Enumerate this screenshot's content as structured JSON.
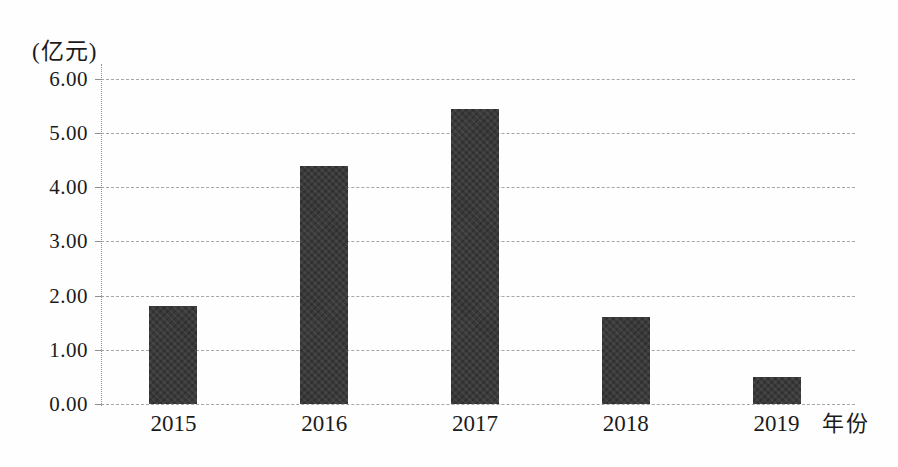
{
  "figure": {
    "unit_label": "(亿元)"
  },
  "chart_data": {
    "type": "bar",
    "title": "",
    "categories": [
      "2015",
      "2016",
      "2017",
      "2018",
      "2019"
    ],
    "values": [
      1.8,
      4.4,
      5.45,
      1.6,
      0.5
    ],
    "xlabel": "年份",
    "ylabel": "(亿元)",
    "ylim": [
      0,
      6
    ],
    "ytick_step": 1.0,
    "ytick_labels": [
      "0.00",
      "1.00",
      "2.00",
      "3.00",
      "4.00",
      "5.00",
      "6.00"
    ],
    "grid": true,
    "gridline_style": "dashed",
    "legend": "none",
    "bar_color": "#3a3a3a",
    "gridline_color": "#a6a6a6",
    "axis_color": "#8f8f8f",
    "text_color": "#1b1b1b"
  }
}
